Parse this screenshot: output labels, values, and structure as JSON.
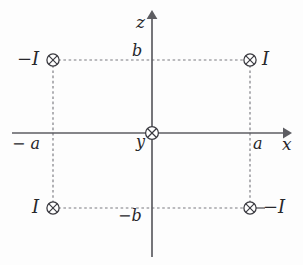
{
  "figure": {
    "type": "physics-diagram",
    "axes": {
      "horizontal": {
        "name": "x-axis",
        "label": "x",
        "arrow": "right"
      },
      "vertical": {
        "name": "z-axis",
        "label": "z",
        "arrow": "up"
      },
      "into_page": {
        "name": "y-axis",
        "label": "y"
      }
    },
    "tick_labels": {
      "x_positive": "a",
      "x_negative": "− a",
      "z_positive": "b",
      "z_negative": "−b"
    },
    "wires": [
      {
        "id": "wire-top-left",
        "label": "−I",
        "symbol": "circled-x",
        "label_side": "left",
        "x": "−a",
        "z": "b"
      },
      {
        "id": "wire-top-right",
        "label": "I",
        "symbol": "circled-x",
        "label_side": "right",
        "x": "a",
        "z": "b"
      },
      {
        "id": "wire-bottom-left",
        "label": "I",
        "symbol": "circled-x",
        "label_side": "left",
        "x": "−a",
        "z": "−b"
      },
      {
        "id": "wire-bottom-right",
        "label": "−I",
        "symbol": "circled-x",
        "label_side": "right",
        "x": "a",
        "z": "−b"
      },
      {
        "id": "wire-origin",
        "label": "y",
        "symbol": "circled-x",
        "label_side": "left",
        "x": "0",
        "z": "0"
      }
    ],
    "colors": {
      "axis": "#5d5d62",
      "dashed": "#7a7a80",
      "symbol": "#3a3a40",
      "text": "#27272b",
      "background": "#fdfdfd"
    }
  }
}
